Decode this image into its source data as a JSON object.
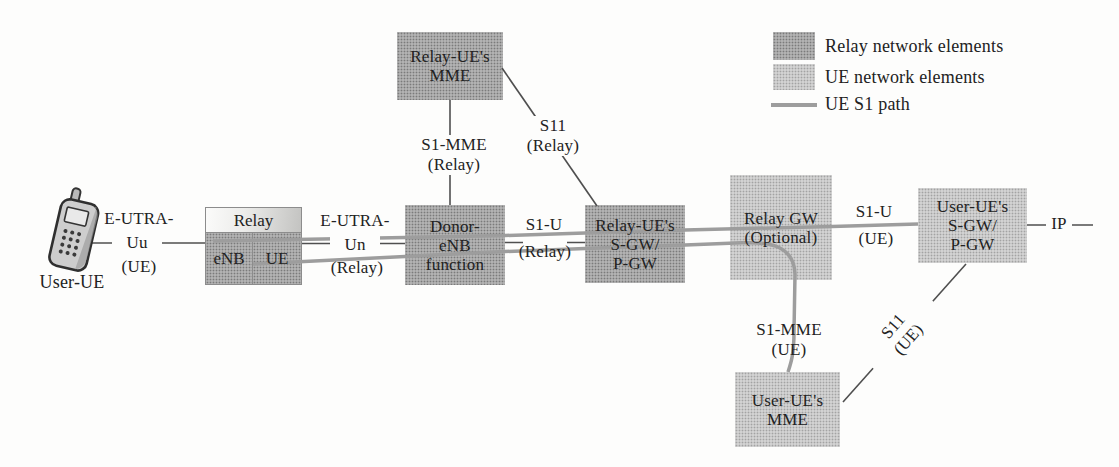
{
  "canvas": {
    "width": 1119,
    "height": 467,
    "background": "#fdfdfc"
  },
  "colors": {
    "relay_element_fill": "#a8a8a8",
    "ue_element_fill": "#cbcbcb",
    "ue_s1_path_line": "#9d9d9d",
    "connector_line": "#4f4f4f",
    "text": "#222222"
  },
  "legend": {
    "items": [
      {
        "label": "Relay network elements",
        "swatch": "relay-dark"
      },
      {
        "label": "UE network elements",
        "swatch": "ue-light"
      },
      {
        "label": "UE S1 path",
        "swatch": "gray-line"
      }
    ]
  },
  "nodes": {
    "user_ue": {
      "label": "User-UE",
      "icon": "mobile-phone-icon"
    },
    "relay_box": {
      "title": "Relay",
      "cells": [
        "eNB",
        "UE"
      ]
    },
    "relay_ue_mme": {
      "lines": [
        "Relay-UE's",
        "MME"
      ]
    },
    "donor_enb": {
      "lines": [
        "Donor-",
        "eNB",
        "function"
      ]
    },
    "relay_ue_sgw_pgw": {
      "lines": [
        "Relay-UE's",
        "S-GW/",
        "P-GW"
      ]
    },
    "relay_gw": {
      "lines": [
        "Relay GW",
        "(Optional)"
      ]
    },
    "user_ue_sgw_pgw": {
      "lines": [
        "User-UE's",
        "S-GW/",
        "P-GW"
      ]
    },
    "user_ue_mme": {
      "lines": [
        "User-UE's",
        "MME"
      ]
    }
  },
  "edge_labels": {
    "e_utra_uu": {
      "lines": [
        "E-UTRA-",
        "Uu",
        "(UE)"
      ]
    },
    "e_utra_un": {
      "lines": [
        "E-UTRA-",
        "Un",
        "(Relay)"
      ]
    },
    "s1_u_relay": {
      "lines": [
        "S1-U",
        "(Relay)"
      ]
    },
    "s1_mme_relay": {
      "lines": [
        "S1-MME",
        "(Relay)"
      ]
    },
    "s11_relay": {
      "lines": [
        "S11",
        "(Relay)"
      ]
    },
    "s1_u_ue": {
      "lines": [
        "S1-U",
        "(UE)"
      ]
    },
    "s1_mme_ue": {
      "lines": [
        "S1-MME",
        "(UE)"
      ]
    },
    "s11_ue": {
      "lines": [
        "S11",
        "(UE)"
      ]
    },
    "ip": {
      "label": "IP"
    }
  }
}
